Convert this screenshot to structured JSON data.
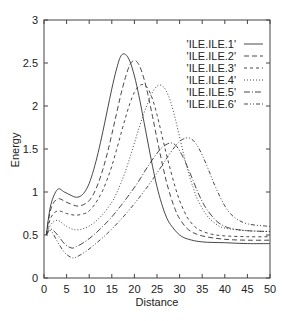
{
  "chart_data": {
    "type": "line",
    "title": "",
    "xlabel": "Distance",
    "ylabel": "Energy",
    "xlim": [
      0,
      50
    ],
    "ylim": [
      0,
      3
    ],
    "xticks": [
      0,
      5,
      10,
      15,
      20,
      25,
      30,
      35,
      40,
      45,
      50
    ],
    "yticks": [
      0,
      0.5,
      1,
      1.5,
      2,
      2.5,
      3
    ],
    "xtick_labels": [
      "0",
      "5",
      "10",
      "15",
      "20",
      "25",
      "30",
      "35",
      "40",
      "45",
      "50"
    ],
    "ytick_labels": [
      "0",
      "0.5",
      "1",
      "1.5",
      "2",
      "2.5",
      "3"
    ],
    "grid": false,
    "legend_position": "upper right",
    "series": [
      {
        "name": "'ILE.ILE.1'",
        "dash": "",
        "x": [
          0.5,
          1.5,
          3,
          4.5,
          6,
          7,
          8,
          9,
          10,
          11,
          12,
          13,
          14,
          15,
          16,
          17,
          18,
          19,
          20,
          21,
          22,
          23,
          24,
          25,
          26,
          27,
          28,
          30,
          32,
          35,
          40,
          45,
          50
        ],
        "y": [
          0.5,
          0.85,
          1.03,
          1.0,
          0.96,
          0.94,
          0.95,
          1.0,
          1.1,
          1.26,
          1.46,
          1.7,
          1.95,
          2.2,
          2.42,
          2.58,
          2.6,
          2.52,
          2.35,
          2.12,
          1.85,
          1.57,
          1.3,
          1.06,
          0.87,
          0.72,
          0.62,
          0.5,
          0.45,
          0.42,
          0.41,
          0.4,
          0.4
        ]
      },
      {
        "name": "'ILE.ILE.2'",
        "dash": "5,3",
        "x": [
          0.5,
          1.5,
          3,
          5,
          7,
          8,
          9,
          10,
          11,
          12,
          13,
          14,
          15,
          16,
          17,
          18,
          19,
          20,
          21,
          22,
          23,
          24,
          25,
          26,
          27,
          28,
          29,
          30,
          32,
          35,
          40,
          45,
          50
        ],
        "y": [
          0.5,
          0.8,
          0.92,
          0.88,
          0.84,
          0.84,
          0.86,
          0.9,
          0.98,
          1.1,
          1.26,
          1.45,
          1.67,
          1.9,
          2.13,
          2.33,
          2.48,
          2.53,
          2.48,
          2.34,
          2.13,
          1.88,
          1.62,
          1.37,
          1.14,
          0.95,
          0.8,
          0.69,
          0.56,
          0.49,
          0.45,
          0.44,
          0.44
        ]
      },
      {
        "name": "'ILE.ILE.3'",
        "dash": "3,3",
        "x": [
          0.5,
          1.5,
          3,
          5,
          7,
          9,
          10,
          11,
          12,
          13,
          14,
          15,
          16,
          17,
          18,
          19,
          20,
          21,
          22,
          23,
          24,
          25,
          26,
          27,
          28,
          29,
          30,
          31,
          32,
          34,
          37,
          40,
          45,
          50
        ],
        "y": [
          0.5,
          0.7,
          0.78,
          0.75,
          0.73,
          0.75,
          0.78,
          0.84,
          0.92,
          1.02,
          1.15,
          1.3,
          1.48,
          1.67,
          1.86,
          2.03,
          2.16,
          2.23,
          2.25,
          2.2,
          2.08,
          1.9,
          1.68,
          1.46,
          1.25,
          1.06,
          0.9,
          0.78,
          0.68,
          0.57,
          0.51,
          0.49,
          0.48,
          0.48
        ]
      },
      {
        "name": "'ILE.ILE.4'",
        "dash": "1,2",
        "x": [
          0.5,
          1.5,
          3,
          5,
          7,
          9,
          11,
          13,
          15,
          16,
          17,
          18,
          19,
          20,
          21,
          22,
          23,
          24,
          25,
          26,
          27,
          28,
          29,
          30,
          31,
          32,
          33,
          34,
          36,
          38,
          40,
          45,
          50
        ],
        "y": [
          0.5,
          0.62,
          0.67,
          0.6,
          0.56,
          0.58,
          0.64,
          0.74,
          0.88,
          0.98,
          1.1,
          1.24,
          1.4,
          1.57,
          1.74,
          1.9,
          2.04,
          2.16,
          2.23,
          2.24,
          2.18,
          2.05,
          1.86,
          1.64,
          1.42,
          1.22,
          1.05,
          0.91,
          0.73,
          0.63,
          0.58,
          0.55,
          0.54
        ]
      },
      {
        "name": "'ILE.ILE.5'",
        "dash": "6,2,1,2",
        "x": [
          0.5,
          1.5,
          3,
          4.5,
          6,
          7,
          9,
          11,
          13,
          15,
          17,
          19,
          21,
          23,
          25,
          26,
          27,
          28,
          29,
          30,
          31,
          32,
          33,
          34,
          35,
          36,
          38,
          40,
          42,
          45,
          50
        ],
        "y": [
          0.5,
          0.57,
          0.5,
          0.4,
          0.35,
          0.36,
          0.42,
          0.5,
          0.6,
          0.71,
          0.84,
          0.98,
          1.13,
          1.3,
          1.45,
          1.51,
          1.55,
          1.57,
          1.55,
          1.48,
          1.38,
          1.26,
          1.13,
          1.0,
          0.89,
          0.8,
          0.67,
          0.6,
          0.57,
          0.55,
          0.54
        ]
      },
      {
        "name": "'ILE.ILE.6'",
        "dash": "4,2,1,2,1,2",
        "x": [
          0.5,
          1.5,
          3,
          4.5,
          6,
          7,
          9,
          11,
          13,
          15,
          17,
          19,
          21,
          23,
          25,
          27,
          28,
          29,
          30,
          31,
          32,
          33,
          34,
          35,
          36,
          37,
          38,
          40,
          42,
          45,
          50
        ],
        "y": [
          0.5,
          0.55,
          0.42,
          0.3,
          0.24,
          0.24,
          0.3,
          0.38,
          0.47,
          0.57,
          0.68,
          0.8,
          0.93,
          1.07,
          1.22,
          1.38,
          1.46,
          1.53,
          1.59,
          1.62,
          1.63,
          1.6,
          1.53,
          1.43,
          1.31,
          1.18,
          1.05,
          0.84,
          0.71,
          0.63,
          0.6
        ]
      }
    ]
  },
  "layout": {
    "plot": {
      "left": 44,
      "top": 20,
      "right": 270,
      "bottom": 278
    },
    "line_color": "#333333",
    "axis_color": "#444444"
  }
}
